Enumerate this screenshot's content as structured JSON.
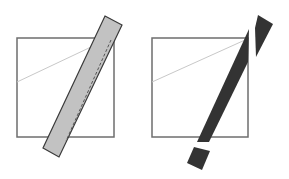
{
  "diagram": {
    "background": "#ffffff",
    "panels": [
      {
        "id": "left",
        "square": {
          "x": 17,
          "y": 38,
          "w": 97,
          "h": 99,
          "stroke": "#6e6e6e"
        },
        "diagonal": {
          "x1": 17,
          "y1": 82,
          "x2": 91,
          "y2": 47,
          "stroke": "#c8c8c8"
        },
        "bar": {
          "points": "105,16 122,25 59,157 43,148",
          "fill": "#c2c2c2",
          "stroke": "#3a3a3a"
        },
        "dashed_line": {
          "x1": 111,
          "y1": 40,
          "x2": 66,
          "y2": 141,
          "stroke": "#555555"
        }
      },
      {
        "id": "right",
        "square": {
          "x": 152,
          "y": 38,
          "w": 96,
          "h": 99,
          "stroke": "#6e6e6e"
        },
        "diagonal": {
          "x1": 152,
          "y1": 82,
          "x2": 245,
          "y2": 40,
          "stroke": "#c8c8c8"
        },
        "pieces": [
          {
            "name": "top-fragment",
            "points": "258,15 273,24 256,57 255,28",
            "fill": "#333333"
          },
          {
            "name": "main-fragment",
            "points": "249,29 248,62 209,142 197,142",
            "fill": "#333333"
          },
          {
            "name": "bottom-fragment",
            "points": "194,147 210,151 202,170 187,163",
            "fill": "#333333"
          }
        ]
      }
    ]
  }
}
